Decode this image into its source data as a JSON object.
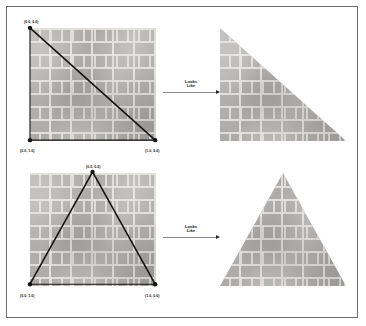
{
  "figure": {
    "panels": [
      {
        "id": "right-triangle-demo",
        "source": {
          "name": "unit-square-with-diagonal",
          "vertices": [
            {
              "name": "top-left",
              "label": "(0.0, 0.0)"
            },
            {
              "name": "bottom-left",
              "label": "(0.0, 1.0)"
            },
            {
              "name": "bottom-right",
              "label": "(1.0, 0.0)"
            }
          ]
        },
        "arrow": {
          "caption_line1": "Looks",
          "caption_line2": "Like"
        },
        "result": {
          "name": "right-triangle",
          "shape": "right-triangle",
          "texture": "brick"
        }
      },
      {
        "id": "isosceles-triangle-demo",
        "source": {
          "name": "unit-square-with-apex-lines",
          "vertices": [
            {
              "name": "top-apex",
              "label": "(0.5, 0.0)"
            },
            {
              "name": "bottom-left",
              "label": "(0.0, 1.0)"
            },
            {
              "name": "bottom-right",
              "label": "(1.0, 0.0)"
            }
          ]
        },
        "arrow": {
          "caption_line1": "Looks",
          "caption_line2": "Like"
        },
        "result": {
          "name": "isosceles-triangle",
          "shape": "isosceles-triangle",
          "texture": "brick"
        }
      }
    ],
    "colors": {
      "frame_border": "#6e6e6e",
      "page_background": "#ffffff",
      "line_stroke": "#141414",
      "vertex_marker": "#141414",
      "brick_body": "#b0aeac",
      "brick_mortar": "#e2e0dc",
      "arrow_line": "#8a8a8a",
      "arrow_head": "#2b2b2b"
    }
  }
}
